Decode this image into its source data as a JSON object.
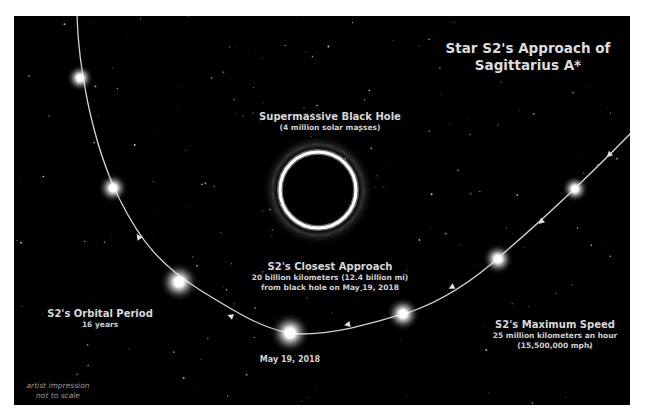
{
  "title": {
    "line1": "Star S2's Approach of",
    "line2": "Sagittarius A*"
  },
  "black_hole": {
    "heading": "Supermassive Black Hole",
    "detail": "(4 million solar masses)",
    "center": [
      318,
      190
    ],
    "radius": 38
  },
  "closest_approach": {
    "heading": "S2's Closest Approach",
    "line1": "20 billion kilometers (12.4 billion mi)",
    "line2": "from black hole on May 19, 2018"
  },
  "orbital_period": {
    "heading": "S2's Orbital Period",
    "detail": "16 years"
  },
  "maximum_speed": {
    "heading": "S2's Maximum Speed",
    "line1": "25 million kilometers an hour",
    "line2": "(15,500,000 mph)"
  },
  "date_label": "May 19, 2018",
  "footnote": {
    "line1": "artist impression",
    "line2": "not to scale"
  },
  "colors": {
    "background": "#000000",
    "border": "#ffffff",
    "text": "#dcdcdc",
    "orbit": "#cfcfcf",
    "star_glow": "#ffffff"
  },
  "star_positions": [
    {
      "x": 80,
      "y": 78,
      "size": 1.0
    },
    {
      "x": 113,
      "y": 188,
      "size": 1.1
    },
    {
      "x": 179,
      "y": 282,
      "size": 1.45
    },
    {
      "x": 290,
      "y": 333,
      "size": 1.5
    },
    {
      "x": 403,
      "y": 314,
      "size": 1.25
    },
    {
      "x": 498,
      "y": 259,
      "size": 1.15
    },
    {
      "x": 575,
      "y": 189,
      "size": 1.0
    }
  ]
}
